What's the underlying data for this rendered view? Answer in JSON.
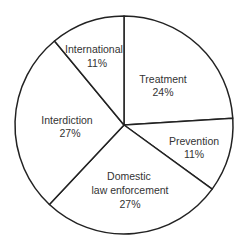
{
  "chart_data": {
    "type": "pie",
    "title": "",
    "categories": [
      "Treatment",
      "Prevention",
      "Domestic law enforcement",
      "Interdiction",
      "International"
    ],
    "values": [
      24,
      11,
      27,
      27,
      11
    ],
    "unit": "%",
    "start_angle_deg": 0,
    "direction": "clockwise",
    "fill_color": "#ffffff",
    "stroke_color": "#222222",
    "legend": "none (labels inside slices)",
    "slices": [
      {
        "label_lines": [
          "Treatment"
        ],
        "pct": "24%",
        "value": 24
      },
      {
        "label_lines": [
          "Prevention"
        ],
        "pct": "11%",
        "value": 11
      },
      {
        "label_lines": [
          "Domestic",
          "law enforcement"
        ],
        "pct": "27%",
        "value": 27
      },
      {
        "label_lines": [
          "Interdiction"
        ],
        "pct": "27%",
        "value": 27
      },
      {
        "label_lines": [
          "International"
        ],
        "pct": "11%",
        "value": 11
      }
    ]
  }
}
